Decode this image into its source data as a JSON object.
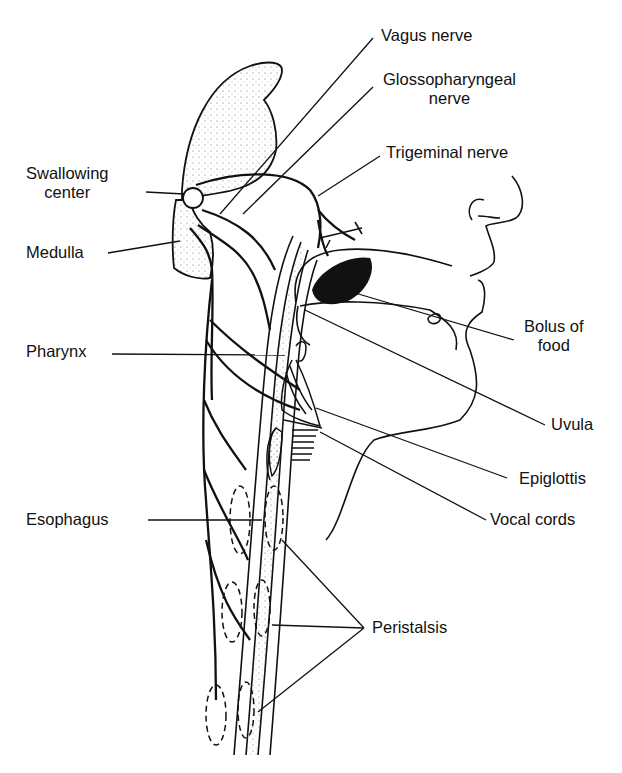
{
  "diagram": {
    "colors": {
      "ink": "#111111",
      "background": "#ffffff",
      "stipple": "#555555"
    },
    "labels": {
      "vagus_nerve": "Vagus nerve",
      "glossopharyngeal_line1": "Glossopharyngeal",
      "glossopharyngeal_line2": "nerve",
      "trigeminal_nerve": "Trigeminal nerve",
      "swallowing_center_line1": "Swallowing",
      "swallowing_center_line2": "center",
      "medulla": "Medulla",
      "pharynx": "Pharynx",
      "bolus_line1": "Bolus of",
      "bolus_line2": "food",
      "uvula": "Uvula",
      "epiglottis": "Epiglottis",
      "vocal_cords": "Vocal cords",
      "esophagus": "Esophagus",
      "peristalsis": "Peristalsis"
    }
  }
}
